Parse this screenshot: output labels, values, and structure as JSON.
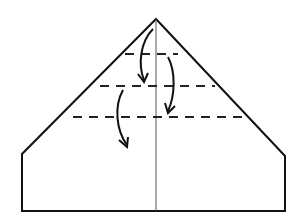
{
  "diagram": {
    "colors": {
      "background": "#ffffff",
      "outline": "#111111",
      "center_line": "#555555",
      "fold_line": "#222222",
      "arrow": "#111111"
    },
    "paper_outline": {
      "apex": [
        156,
        19
      ],
      "left_shoulder": [
        22,
        154
      ],
      "right_shoulder": [
        285,
        156
      ],
      "bottom_left": [
        22,
        211
      ],
      "bottom_right": [
        285,
        211
      ]
    },
    "center_crease": {
      "x": 156,
      "y1": 19,
      "y2": 211
    },
    "fold_lines": [
      {
        "label": "fold line 1",
        "y": 54,
        "x1": 125,
        "x2": 178
      },
      {
        "label": "fold line 2",
        "y": 86,
        "x1": 100,
        "x2": 215
      },
      {
        "label": "fold line 3",
        "y": 117,
        "x1": 73,
        "x2": 248
      }
    ],
    "fold_arrows": [
      {
        "label": "fold tip down to line 2",
        "from": [
          153,
          29
        ],
        "to": [
          144,
          82
        ]
      },
      {
        "label": "fold line 1 down to line 3",
        "from": [
          168,
          57
        ],
        "to": [
          168,
          113
        ]
      },
      {
        "label": "fold line 2 down",
        "from": [
          123,
          90
        ],
        "to": [
          127,
          147
        ]
      }
    ]
  }
}
